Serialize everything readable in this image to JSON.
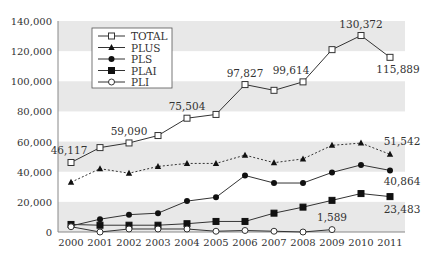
{
  "chart_data": {
    "type": "line",
    "title": "",
    "xlabel": "",
    "ylabel": "",
    "ylim": [
      0,
      140000
    ],
    "yticks": [
      0,
      20000,
      40000,
      60000,
      80000,
      100000,
      120000,
      140000
    ],
    "ytick_labels": [
      "0",
      "20,000",
      "40,000",
      "60,000",
      "80,000",
      "100,000",
      "120,000",
      "140,000"
    ],
    "categories": [
      "2000",
      "2001",
      "2002",
      "2003",
      "2004",
      "2005",
      "2006",
      "2007",
      "2008",
      "2009",
      "2010",
      "2011"
    ],
    "grid": "alternating horizontal gray bands",
    "legend_position": "upper-left inside plot",
    "series": [
      {
        "name": "TOTAL",
        "marker": "open-square",
        "line": "solid",
        "values": [
          46117,
          56000,
          59090,
          64000,
          75504,
          78000,
          97827,
          94000,
          99614,
          121000,
          130372,
          115889
        ]
      },
      {
        "name": "PLUS",
        "marker": "filled-triangle",
        "line": "dotted",
        "values": [
          33000,
          42000,
          39000,
          43500,
          45500,
          45500,
          51000,
          46000,
          48500,
          57500,
          59000,
          51542
        ]
      },
      {
        "name": "PLS",
        "marker": "filled-circle",
        "line": "solid",
        "values": [
          4000,
          8500,
          11500,
          12500,
          20500,
          23000,
          37500,
          32500,
          32500,
          39500,
          44500,
          40864
        ]
      },
      {
        "name": "PLAI",
        "marker": "filled-square",
        "line": "solid",
        "values": [
          5000,
          4500,
          4500,
          4500,
          5500,
          7000,
          7000,
          12500,
          16500,
          21000,
          25500,
          23483
        ]
      },
      {
        "name": "PLI",
        "marker": "open-circle",
        "line": "solid",
        "values": [
          3500,
          0,
          2000,
          2000,
          2000,
          500,
          1000,
          500,
          0,
          1589,
          null,
          null
        ]
      }
    ],
    "annotations": [
      {
        "series": "TOTAL",
        "x": "2000",
        "text": "46,117"
      },
      {
        "series": "TOTAL",
        "x": "2002",
        "text": "59,090"
      },
      {
        "series": "TOTAL",
        "x": "2004",
        "text": "75,504"
      },
      {
        "series": "TOTAL",
        "x": "2006",
        "text": "97,827"
      },
      {
        "series": "TOTAL",
        "x": "2008",
        "text": "99,614"
      },
      {
        "series": "TOTAL",
        "x": "2010",
        "text": "130,372"
      },
      {
        "series": "TOTAL",
        "x": "2011",
        "text": "115,889"
      },
      {
        "series": "PLUS",
        "x": "2011",
        "text": "51,542"
      },
      {
        "series": "PLS",
        "x": "2011",
        "text": "40,864"
      },
      {
        "series": "PLAI",
        "x": "2011",
        "text": "23,483"
      },
      {
        "series": "PLI",
        "x": "2009",
        "text": "1,589"
      }
    ]
  },
  "colors": {
    "band": "#e8e8e8",
    "line": "#333333",
    "axis": "#888888",
    "text": "#333333"
  }
}
